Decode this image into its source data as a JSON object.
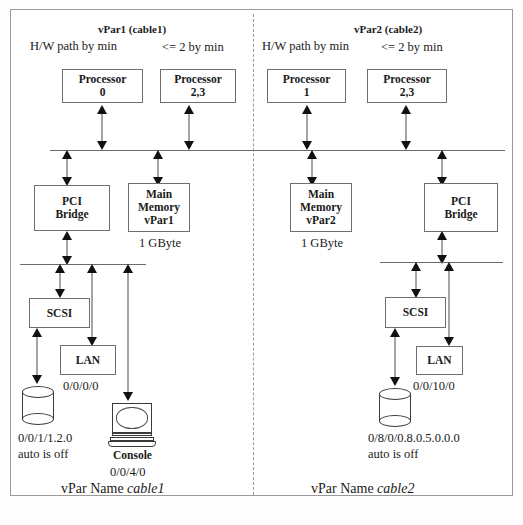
{
  "diagram": {
    "title_left": "vPar1 (cable1)",
    "title_right": "vPar2 (cable2)",
    "hw_path_label": "H/W path by min",
    "le2_label": "<= 2 by min",
    "footer_left_prefix": "vPar Name ",
    "footer_left_name": "cable1",
    "footer_right_prefix": "vPar Name ",
    "footer_right_name": "cable2"
  },
  "left": {
    "proc_a_line1": "Processor",
    "proc_a_line2": "0",
    "proc_b_line1": "Processor",
    "proc_b_line2": "2,3",
    "pci_line1": "PCI",
    "pci_line2": "Bridge",
    "mem_line1": "Main",
    "mem_line2": "Memory",
    "mem_line3": "vPar1",
    "mem_size": "1 GByte",
    "scsi": "SCSI",
    "lan": "LAN",
    "lan_path": "0/0/0/0",
    "disk_path": "0/0/1/1.2.0",
    "disk_auto": "auto is off",
    "console_label": "Console",
    "console_path": "0/0/4/0"
  },
  "right": {
    "proc_a_line1": "Processor",
    "proc_a_line2": "1",
    "proc_b_line1": "Processor",
    "proc_b_line2": "2,3",
    "pci_line1": "PCI",
    "pci_line2": "Bridge",
    "mem_line1": "Main",
    "mem_line2": "Memory",
    "mem_line3": "vPar2",
    "mem_size": "1 GByte",
    "scsi": "SCSI",
    "lan": "LAN",
    "lan_path": "0/0/10/0",
    "disk_path": "0/8/0/0.8.0.5.0.0.0",
    "disk_auto": "auto is off"
  },
  "colors": {
    "border": "#6e6e6e",
    "bus": "#6b6b6b",
    "arrow": "#111111",
    "frame": "#9a9a9a",
    "divider": "#9b9b9b"
  }
}
